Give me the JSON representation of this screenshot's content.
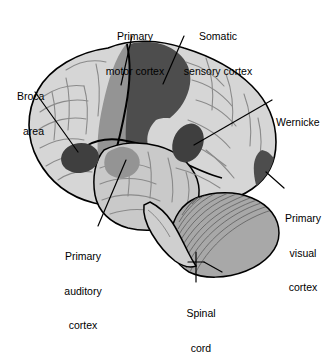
{
  "figure": {
    "type": "anatomical-diagram",
    "background_color": "#ffffff"
  },
  "palette": {
    "outline": "#000000",
    "cortex_light": "#d6d6d6",
    "cortex_shadow": "#c2c2c2",
    "region_medium": "#949494",
    "region_dark": "#4d4d4d",
    "cerebellum": "#a8a8a8",
    "gyri_line": "#8a8a8a",
    "label_text": "#000000",
    "leader_line": "#000000"
  },
  "labels": [
    {
      "id": "primary-motor-cortex",
      "lines": [
        "Primary",
        "motor cortex"
      ],
      "align": "center",
      "x": 98,
      "y": 8
    },
    {
      "id": "somatic-sensory-cortex",
      "lines": [
        "Somatic",
        "sensory cortex"
      ],
      "align": "center",
      "x": 176,
      "y": 8
    },
    {
      "id": "broca-area",
      "lines": [
        "Broca",
        "area"
      ],
      "align": "left",
      "x": 17,
      "y": 68
    },
    {
      "id": "wernicke",
      "lines": [
        "Wernicke"
      ],
      "align": "left",
      "x": 276,
      "y": 94
    },
    {
      "id": "primary-visual-cortex",
      "lines": [
        "Primary",
        "visual",
        "cortex"
      ],
      "align": "center",
      "x": 278,
      "y": 190
    },
    {
      "id": "primary-auditory-cortex",
      "lines": [
        "Primary",
        "auditory",
        "cortex"
      ],
      "align": "center",
      "x": 52,
      "y": 228
    },
    {
      "id": "spinal-cord",
      "lines": [
        "Spinal",
        "cord"
      ],
      "align": "center",
      "x": 180,
      "y": 285
    }
  ],
  "regions": [
    {
      "id": "primary-motor-strip",
      "shade": "region_medium"
    },
    {
      "id": "somatic-sensory-strip",
      "shade": "region_dark"
    },
    {
      "id": "broca-blob",
      "shade": "region_dark"
    },
    {
      "id": "wernicke-blob",
      "shade": "region_dark"
    },
    {
      "id": "primary-visual-patch",
      "shade": "region_dark"
    },
    {
      "id": "primary-auditory-patch",
      "shade": "region_medium"
    },
    {
      "id": "cerebellum",
      "shade": "cerebellum"
    },
    {
      "id": "brainstem",
      "shade": "cortex_light"
    }
  ]
}
